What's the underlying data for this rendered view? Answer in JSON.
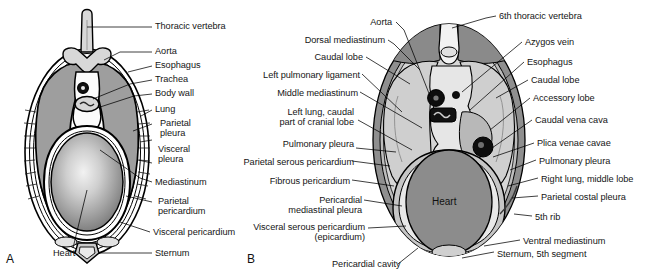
{
  "figure": {
    "type": "anatomical-diagram",
    "panels": [
      {
        "id": "A",
        "letter": "A",
        "description": "Schematic transverse section of thorax"
      },
      {
        "id": "B",
        "letter": "B",
        "description": "Transverse section at the 5th-6th thoracic level"
      }
    ]
  },
  "panelA": {
    "letter": "A",
    "labels_right": [
      "Thoracic vertebra",
      "Aorta",
      "Esophagus",
      "Trachea",
      "Body wall",
      "Lung",
      "Parietal\npleura",
      "Visceral\npleura",
      "Mediastinum",
      "Parietal\npericardium",
      "Visceral pericardium",
      "Sternum"
    ],
    "labels_bottom": [
      "Heart"
    ],
    "organ_labels": {
      "heart": "Heart"
    }
  },
  "panelB": {
    "letter": "B",
    "labels_left": [
      "Aorta",
      "Dorsal mediastinum",
      "Caudal lobe",
      "Left pulmonary ligament",
      "Middle mediastinum",
      "Left lung, caudal\npart of cranial lobe",
      "Pulmonary pleura",
      "Parietal serous pericardium",
      "Fibrous pericardium",
      "Pericardial\nmediastinal pleura",
      "Visceral serous pericardium\n(epicardium)",
      "Pericardial cavity"
    ],
    "labels_right": [
      "6th thoracic vertebra",
      "Azygos vein",
      "Esophagus",
      "Caudal lobe",
      "Accessory lobe",
      "Caudal vena cava",
      "Plica venae cavae",
      "Pulmonary pleura",
      "Right lung, middle lobe",
      "Parietal costal pleura",
      "5th rib",
      "Ventral mediastinum",
      "Sternum, 5th segment"
    ],
    "organ_labels": {
      "heart": "Heart"
    }
  },
  "colors": {
    "background": "#ffffff",
    "outline": "#000000",
    "body_wall_dark": "#7d7d7d",
    "lung_mid": "#a3a3a3",
    "lung_light": "#d2d2d2",
    "heart_gray": "#8a8a8a",
    "vessel_black": "#0d0d0d",
    "cavity_white": "#f4f4f4",
    "label_text": "#151515"
  }
}
